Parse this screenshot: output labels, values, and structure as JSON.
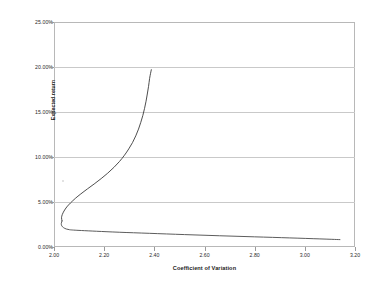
{
  "chart_data": {
    "type": "line",
    "title": "",
    "xlabel": "Coefficient of Variation",
    "ylabel": "Expected return",
    "xlim": [
      2.0,
      3.2
    ],
    "ylim": [
      0.0,
      25.0
    ],
    "x_tick_labels": [
      "2.00",
      "2.20",
      "2.40",
      "2.60",
      "2.80",
      "3.00",
      "3.20"
    ],
    "x_tick_values": [
      2.0,
      2.2,
      2.4,
      2.6,
      2.8,
      3.0,
      3.2
    ],
    "y_tick_labels": [
      "0.00%",
      "5.00%",
      "10.00%",
      "15.00%",
      "20.00%",
      "25.00%"
    ],
    "y_tick_values": [
      0.0,
      5.0,
      10.0,
      15.0,
      20.0,
      25.0
    ],
    "grid": "horizontal",
    "legend": "none",
    "line_color": "#3a3a3a",
    "grid_color": "#c9c9c9",
    "frame_color": "#b8b8b8",
    "series": [
      {
        "name": "Efficient frontier (upper branch)",
        "points": [
          [
            2.032,
            2.9
          ],
          [
            2.03,
            3.25
          ],
          [
            2.033,
            3.6
          ],
          [
            2.04,
            4.0
          ],
          [
            2.051,
            4.45
          ],
          [
            2.066,
            4.9
          ],
          [
            2.085,
            5.4
          ],
          [
            2.107,
            5.9
          ],
          [
            2.133,
            6.45
          ],
          [
            2.16,
            7.0
          ],
          [
            2.188,
            7.6
          ],
          [
            2.214,
            8.2
          ],
          [
            2.239,
            8.85
          ],
          [
            2.261,
            9.5
          ],
          [
            2.281,
            10.2
          ],
          [
            2.298,
            10.9
          ],
          [
            2.313,
            11.6
          ],
          [
            2.326,
            12.35
          ],
          [
            2.337,
            13.1
          ],
          [
            2.346,
            13.85
          ],
          [
            2.354,
            14.6
          ],
          [
            2.361,
            15.4
          ],
          [
            2.367,
            16.2
          ],
          [
            2.372,
            17.0
          ],
          [
            2.377,
            17.85
          ],
          [
            2.381,
            18.7
          ],
          [
            2.385,
            19.3
          ],
          [
            2.388,
            19.7
          ]
        ]
      },
      {
        "name": "Inefficient frontier (lower branch)",
        "points": [
          [
            2.032,
            2.9
          ],
          [
            2.029,
            2.6
          ],
          [
            2.031,
            2.35
          ],
          [
            2.038,
            2.15
          ],
          [
            2.049,
            2.0
          ],
          [
            2.062,
            1.92
          ],
          [
            2.078,
            1.88
          ],
          [
            2.11,
            1.83
          ],
          [
            2.17,
            1.75
          ],
          [
            2.26,
            1.64
          ],
          [
            2.38,
            1.52
          ],
          [
            2.52,
            1.38
          ],
          [
            2.66,
            1.25
          ],
          [
            2.8,
            1.13
          ],
          [
            2.94,
            1.01
          ],
          [
            3.06,
            0.9
          ],
          [
            3.14,
            0.82
          ]
        ]
      }
    ]
  },
  "axes": {
    "x_title": "Coefficient of Variation",
    "y_title": "Expected return"
  }
}
